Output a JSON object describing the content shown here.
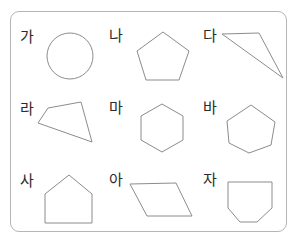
{
  "worksheet": {
    "title": "Geometric shapes worksheet",
    "frame_color": "#b5b5b5",
    "shape_stroke_color": "#8c8c8c",
    "label_color": "#2b2b2b",
    "background_color": "#ffffff",
    "rows": 3,
    "columns": 3
  },
  "cells": [
    {
      "label": "가",
      "shape_name": "circle",
      "shape_kind": "circle",
      "label_x": 20,
      "label_y": 30,
      "geometry": {
        "cx": 70,
        "cy": 56,
        "r": 23
      }
    },
    {
      "label": "나",
      "shape_name": "regular-pentagon",
      "shape_kind": "polygon",
      "label_x": 109,
      "label_y": 29,
      "geometry": {
        "points": "163,32 189,51 179,80 146,80 137,51"
      }
    },
    {
      "label": "다",
      "shape_name": "obtuse-triangle",
      "shape_kind": "polygon",
      "label_x": 203,
      "label_y": 29,
      "geometry": {
        "points": "222,34 259,33 283,78"
      }
    },
    {
      "label": "라",
      "shape_name": "irregular-quadrilateral",
      "shape_kind": "polygon",
      "label_x": 20,
      "label_y": 102,
      "geometry": {
        "points": "48,108 81,102 92,142 38,123"
      }
    },
    {
      "label": "마",
      "shape_name": "regular-hexagon",
      "shape_kind": "polygon",
      "label_x": 109,
      "label_y": 101,
      "geometry": {
        "points": "162,104 183,116 183,140 162,152 141,140 141,116"
      }
    },
    {
      "label": "바",
      "shape_name": "irregular-hexagon",
      "shape_kind": "polygon",
      "label_x": 203,
      "label_y": 101,
      "geometry": {
        "points": "251,105 275,122 271,145 249,153 229,143 227,121"
      }
    },
    {
      "label": "사",
      "shape_name": "house-pentagon",
      "shape_kind": "polygon",
      "label_x": 20,
      "label_y": 174,
      "geometry": {
        "points": "69,175 92,194 92,223 45,223 45,194"
      }
    },
    {
      "label": "아",
      "shape_name": "parallelogram",
      "shape_kind": "polygon",
      "label_x": 109,
      "label_y": 173,
      "geometry": {
        "points": "130,184 176,183 192,216 147,216"
      }
    },
    {
      "label": "자",
      "shape_name": "inverted-house-pentagon",
      "shape_kind": "polygon",
      "label_x": 203,
      "label_y": 173,
      "geometry": {
        "points": "228,182 272,182 272,208 257,222 240,222 228,208"
      }
    }
  ]
}
